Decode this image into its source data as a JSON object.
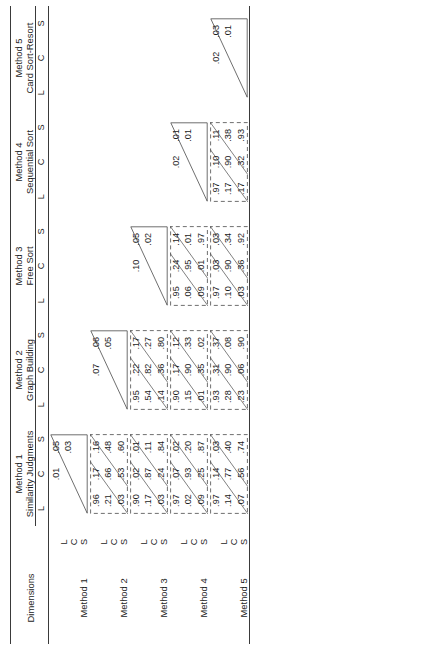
{
  "figure": {
    "orientation": "rotated-90-ccw",
    "row_header_label": "Dimensions",
    "dimension_codes": [
      "L",
      "C",
      "S"
    ]
  },
  "columns": [
    {
      "method": "Method 1",
      "name": "Similarity Judgments",
      "sub": [
        "L",
        "C",
        "S"
      ]
    },
    {
      "method": "Method 2",
      "name": "Graph Building",
      "sub": [
        "L",
        "C",
        "S"
      ]
    },
    {
      "method": "Method 3",
      "name": "Free Sort",
      "sub": [
        "L",
        "C",
        "S"
      ]
    },
    {
      "method": "Method 4",
      "name": "Sequential Sort",
      "sub": [
        "L",
        "C",
        "S"
      ]
    },
    {
      "method": "Method 5",
      "name": "Card Sort-Resort",
      "sub": [
        "L",
        "C",
        "S"
      ]
    }
  ],
  "rows": [
    {
      "method": "Method 1",
      "dims": [
        "L",
        "C",
        "S"
      ]
    },
    {
      "method": "Method 2",
      "dims": [
        "L",
        "C",
        "S"
      ]
    },
    {
      "method": "Method 3",
      "dims": [
        "L",
        "C",
        "S"
      ]
    },
    {
      "method": "Method 4",
      "dims": [
        "L",
        "C",
        "S"
      ]
    },
    {
      "method": "Method 5",
      "dims": [
        "L",
        "C",
        "S"
      ]
    }
  ],
  "chart_data": {
    "type": "table",
    "row_groups": [
      "Method 1",
      "Method 2",
      "Method 3",
      "Method 4",
      "Method 5"
    ],
    "col_groups": [
      "Method 1",
      "Method 2",
      "Method 3",
      "Method 4",
      "Method 5"
    ],
    "col_group_names": [
      "Similarity Judgments",
      "Graph Building",
      "Free Sort",
      "Sequential Sort",
      "Card Sort-Resort"
    ],
    "dimensions": [
      "L",
      "C",
      "S"
    ],
    "cells": {
      "r1c1": {
        "style": "triangle",
        "values": [
          [
            "",
            ".01",
            ".05"
          ],
          [
            "",
            "",
            ".03"
          ],
          [
            "",
            "",
            ""
          ]
        ]
      },
      "r2c1": {
        "style": "dashed",
        "values": [
          [
            ".96",
            ".17",
            ".16"
          ],
          [
            ".21",
            ".66",
            ".48"
          ],
          [
            ".03",
            ".53",
            ".60"
          ]
        ]
      },
      "r2c2": {
        "style": "triangle",
        "values": [
          [
            "",
            ".07",
            ".06"
          ],
          [
            "",
            "",
            ".05"
          ],
          [
            "",
            "",
            ""
          ]
        ]
      },
      "r3c1": {
        "style": "dashed",
        "values": [
          [
            ".90",
            ".02",
            ".01"
          ],
          [
            ".17",
            ".87",
            ".11"
          ],
          [
            ".03",
            ".24",
            ".84"
          ]
        ]
      },
      "r3c2": {
        "style": "dashed",
        "values": [
          [
            ".95",
            ".22",
            ".17"
          ],
          [
            ".54",
            ".82",
            ".27"
          ],
          [
            ".14",
            ".36",
            ".80"
          ]
        ]
      },
      "r3c3": {
        "style": "triangle",
        "values": [
          [
            "",
            ".10",
            ".05"
          ],
          [
            "",
            "",
            ".02"
          ],
          [
            "",
            "",
            ""
          ]
        ]
      },
      "r4c1": {
        "style": "dashed",
        "values": [
          [
            ".97",
            ".07",
            ".02"
          ],
          [
            ".02",
            ".93",
            ".20"
          ],
          [
            ".09",
            ".25",
            ".87"
          ]
        ]
      },
      "r4c2": {
        "style": "dashed",
        "values": [
          [
            ".90",
            ".17",
            ".12"
          ],
          [
            ".15",
            ".90",
            ".33"
          ],
          [
            ".01",
            ".35",
            ".02"
          ]
        ]
      },
      "r4c3": {
        "style": "dashed",
        "values": [
          [
            ".95",
            ".24",
            ".14"
          ],
          [
            ".06",
            ".95",
            ".01"
          ],
          [
            ".09",
            ".01",
            ".97"
          ]
        ]
      },
      "r4c4": {
        "style": "triangle",
        "values": [
          [
            "",
            ".02",
            ".01"
          ],
          [
            "",
            "",
            ".01"
          ],
          [
            "",
            "",
            ""
          ]
        ]
      },
      "r5c1": {
        "style": "dashed",
        "values": [
          [
            ".97",
            ".14",
            ".03"
          ],
          [
            ".14",
            ".77",
            ".40"
          ],
          [
            ".07",
            ".56",
            ".74"
          ]
        ]
      },
      "r5c2": {
        "style": "dashed",
        "values": [
          [
            ".93",
            ".31",
            ".37"
          ],
          [
            ".28",
            ".90",
            ".08"
          ],
          [
            ".23",
            ".06",
            ".90"
          ]
        ]
      },
      "r5c3": {
        "style": "dashed",
        "values": [
          [
            ".97",
            ".03",
            ".03"
          ],
          [
            ".10",
            ".90",
            ".34"
          ],
          [
            ".03",
            ".36",
            ".92"
          ]
        ]
      },
      "r5c4": {
        "style": "dashed",
        "values": [
          [
            ".97",
            ".10",
            ".11"
          ],
          [
            ".17",
            ".90",
            ".38"
          ],
          [
            ".17",
            ".32",
            ".93"
          ]
        ]
      },
      "r5c5": {
        "style": "triangle",
        "values": [
          [
            "",
            ".02",
            ".03"
          ],
          [
            "",
            "",
            ".01"
          ],
          [
            "",
            "",
            ""
          ]
        ]
      }
    }
  }
}
